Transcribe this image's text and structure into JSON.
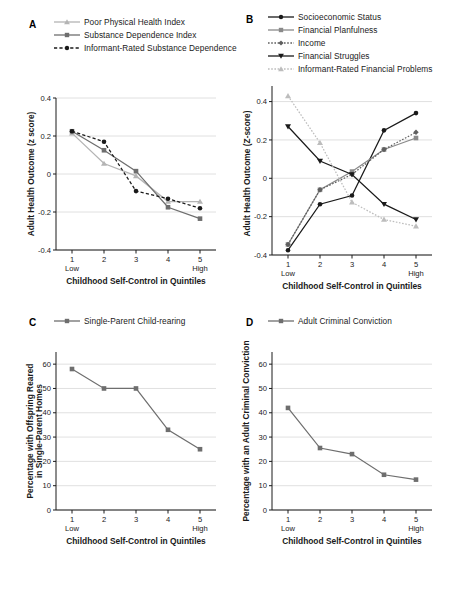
{
  "figure": {
    "xaxis_title": "Childhood Self-Control in Quintiles",
    "xtick_labels": [
      "1",
      "2",
      "3",
      "4",
      "5"
    ],
    "x_low_label": "Low",
    "x_high_label": "High",
    "caption_fragment": ""
  },
  "panels": [
    {
      "letter": "A",
      "ylabel": "Adult Health Outcome (z score)",
      "yticks": [
        "0.4",
        "0.2",
        "0",
        "-0.2",
        "-0.4"
      ],
      "legend": [
        {
          "label": "Poor Physical Health Index",
          "color": "#b4b4b4",
          "marker": "triangle",
          "dash": "solid"
        },
        {
          "label": "Substance Dependence Index",
          "color": "#6e6e6e",
          "marker": "square",
          "dash": "solid"
        },
        {
          "label": "Informant-Rated Substance Dependence",
          "color": "#1a1a1a",
          "marker": "circle",
          "dash": "dashed"
        }
      ]
    },
    {
      "letter": "B",
      "ylabel": "Adult Health Outcome (Z-score)",
      "yticks": [
        "0.4",
        "0.2",
        "0",
        "-0.2",
        "-0.4"
      ],
      "legend": [
        {
          "label": "Socioeconomic Status",
          "color": "#1a1a1a",
          "marker": "circle",
          "dash": "solid"
        },
        {
          "label": "Financial Planfulness",
          "color": "#8a8a8a",
          "marker": "square",
          "dash": "solid"
        },
        {
          "label": "Income",
          "color": "#5f5f5f",
          "marker": "diamond",
          "dash": "dotted"
        },
        {
          "label": "Financial Struggles",
          "color": "#1a1a1a",
          "marker": "triangle-down",
          "dash": "solid"
        },
        {
          "label": "Informant-Rated Financial Problems",
          "color": "#bdbdbd",
          "marker": "triangle",
          "dash": "dotted"
        }
      ]
    },
    {
      "letter": "C",
      "ylabel": "Percentage with Offspring Reared in Single-Parent Homes",
      "yticks": [
        "60",
        "50",
        "40",
        "30",
        "20",
        "10",
        "0"
      ],
      "legend": [
        {
          "label": "Single-Parent Child-rearing",
          "color": "#6e6e6e",
          "marker": "square",
          "dash": "solid"
        }
      ]
    },
    {
      "letter": "D",
      "ylabel": "Percentage with an Adult Criminal Conviction",
      "yticks": [
        "60",
        "50",
        "40",
        "30",
        "20",
        "10",
        "0"
      ],
      "legend": [
        {
          "label": "Adult Criminal Conviction",
          "color": "#6e6e6e",
          "marker": "square",
          "dash": "solid"
        }
      ]
    }
  ],
  "chart_data": [
    {
      "panel": "A",
      "type": "line",
      "title": "",
      "xlabel": "Childhood Self-Control in Quintiles",
      "ylabel": "Adult Health Outcome (z score)",
      "categories": [
        "1",
        "2",
        "3",
        "4",
        "5"
      ],
      "x_tick_sublabels": {
        "1": "Low",
        "5": "High"
      },
      "ylim": [
        -0.4,
        0.4
      ],
      "ytick_values": [
        0.4,
        0.2,
        0,
        -0.2,
        -0.4
      ],
      "grid": true,
      "legend_position": "above-plot",
      "series": [
        {
          "name": "Poor Physical Health Index",
          "values": [
            0.215,
            0.055,
            -0.01,
            -0.145,
            -0.145
          ],
          "color": "#b4b4b4",
          "marker": "triangle",
          "dash": "solid"
        },
        {
          "name": "Substance Dependence Index",
          "values": [
            0.225,
            0.125,
            0.015,
            -0.175,
            -0.235
          ],
          "color": "#6e6e6e",
          "marker": "square",
          "dash": "solid"
        },
        {
          "name": "Informant-Rated Substance Dependence",
          "values": [
            0.225,
            0.17,
            -0.09,
            -0.13,
            -0.18
          ],
          "color": "#1a1a1a",
          "marker": "circle",
          "dash": "dashed"
        }
      ]
    },
    {
      "panel": "B",
      "type": "line",
      "title": "",
      "xlabel": "Childhood Self-Control in Quintiles",
      "ylabel": "Adult Health Outcome (Z-score)",
      "categories": [
        "1",
        "2",
        "3",
        "4",
        "5"
      ],
      "x_tick_sublabels": {
        "1": "Low",
        "5": "High"
      },
      "ylim": [
        -0.4,
        0.45
      ],
      "ytick_values": [
        0.4,
        0.2,
        0,
        -0.2,
        -0.4
      ],
      "grid": true,
      "legend_position": "above-plot",
      "series": [
        {
          "name": "Socioeconomic Status",
          "values": [
            -0.375,
            -0.135,
            -0.09,
            0.25,
            0.34
          ],
          "color": "#1a1a1a",
          "marker": "circle",
          "dash": "solid"
        },
        {
          "name": "Financial Planfulness",
          "values": [
            -0.345,
            -0.06,
            0.035,
            0.15,
            0.21
          ],
          "color": "#8a8a8a",
          "marker": "square",
          "dash": "solid"
        },
        {
          "name": "Income",
          "values": [
            -0.345,
            -0.06,
            0.02,
            0.15,
            0.24
          ],
          "color": "#5f5f5f",
          "marker": "diamond",
          "dash": "dotted"
        },
        {
          "name": "Financial Struggles",
          "values": [
            0.27,
            0.09,
            0.02,
            -0.135,
            -0.215
          ],
          "color": "#1a1a1a",
          "marker": "triangle-down",
          "dash": "solid"
        },
        {
          "name": "Informant-Rated Financial Problems",
          "values": [
            0.43,
            0.185,
            -0.125,
            -0.215,
            -0.25
          ],
          "color": "#bdbdbd",
          "marker": "triangle",
          "dash": "dotted"
        }
      ]
    },
    {
      "panel": "C",
      "type": "line",
      "title": "",
      "xlabel": "Childhood Self-Control in Quintiles",
      "ylabel": "Percentage with Offspring Reared in Single-Parent Homes",
      "categories": [
        "1",
        "2",
        "3",
        "4",
        "5"
      ],
      "x_tick_sublabels": {
        "1": "Low",
        "5": "High"
      },
      "ylim": [
        0,
        65
      ],
      "ytick_values": [
        60,
        50,
        40,
        30,
        20,
        10,
        0
      ],
      "grid": true,
      "legend_position": "above-plot",
      "series": [
        {
          "name": "Single-Parent Child-rearing",
          "values": [
            58,
            50,
            50,
            33,
            25
          ],
          "color": "#6e6e6e",
          "marker": "square",
          "dash": "solid"
        }
      ]
    },
    {
      "panel": "D",
      "type": "line",
      "title": "",
      "xlabel": "Childhood Self-Control in Quintiles",
      "ylabel": "Percentage with an Adult Criminal Conviction",
      "categories": [
        "1",
        "2",
        "3",
        "4",
        "5"
      ],
      "x_tick_sublabels": {
        "1": "Low",
        "5": "High"
      },
      "ylim": [
        0,
        65
      ],
      "ytick_values": [
        60,
        50,
        40,
        30,
        20,
        10,
        0
      ],
      "grid": true,
      "legend_position": "above-plot",
      "series": [
        {
          "name": "Adult Criminal Conviction",
          "values": [
            42,
            25.5,
            23,
            14.5,
            12.5
          ],
          "color": "#6e6e6e",
          "marker": "square",
          "dash": "solid"
        }
      ]
    }
  ]
}
